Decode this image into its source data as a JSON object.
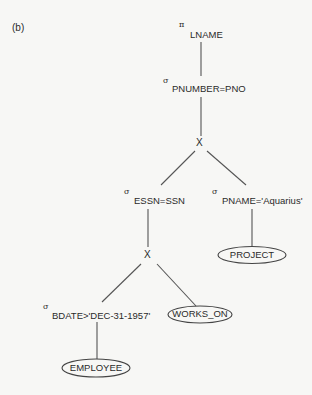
{
  "figure_label": "(b)",
  "nodes": {
    "project": {
      "symbol": "π",
      "subscript": "LNAME"
    },
    "select_pnumber": {
      "symbol": "σ",
      "subscript": "PNUMBER=PNO"
    },
    "cross_top": {
      "symbol": "X"
    },
    "select_essn": {
      "symbol": "σ",
      "subscript": "ESSN=SSN"
    },
    "select_pname": {
      "symbol": "σ",
      "subscript": "PNAME='Aquarius'"
    },
    "relation_project": {
      "label": "PROJECT"
    },
    "cross_bottom": {
      "symbol": "X"
    },
    "select_bdate": {
      "symbol": "σ",
      "subscript": "BDATE>'DEC-31-1957'"
    },
    "relation_works_on": {
      "label": "WORKS_ON"
    },
    "relation_employee": {
      "label": "EMPLOYEE"
    }
  },
  "colors": {
    "background": "#f7f7f5",
    "stroke": "#555555",
    "text": "#2a2a2a"
  }
}
